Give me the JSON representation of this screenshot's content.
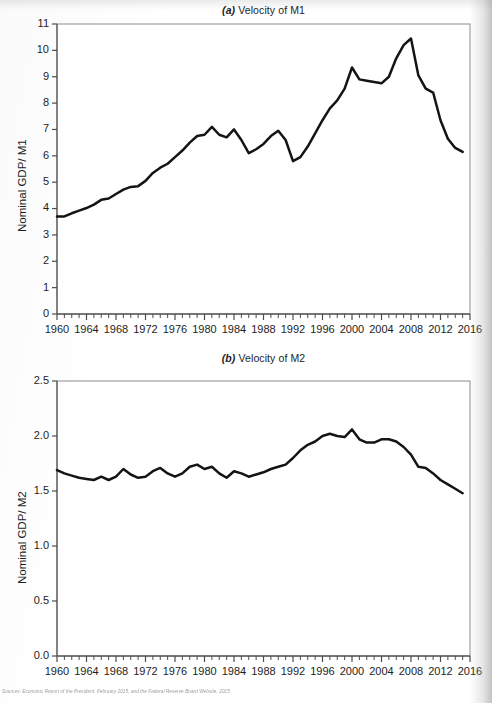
{
  "figure": {
    "source_note_prefix": "Sources:",
    "source_note": "Economic Report of the President, February 2015, and the Federal Reserve Board Website, 2015"
  },
  "panel_a": {
    "title_tag": "(a)",
    "title_text": " Velocity of M1",
    "ylabel": "Nominal GDP/ M1"
  },
  "panel_b": {
    "title_tag": "(b)",
    "title_text": " Velocity of M2",
    "ylabel": "Nominal GDP/ M2"
  },
  "chart_data": [
    {
      "type": "line",
      "title": "(a) Velocity of M1",
      "xlabel": "",
      "ylabel": "Nominal GDP/ M1",
      "xlim": [
        1960,
        2016
      ],
      "ylim": [
        0,
        11
      ],
      "yticks": [
        0,
        1,
        2,
        3,
        4,
        5,
        6,
        7,
        8,
        9,
        10,
        11
      ],
      "ytick_labels": [
        "0",
        "1",
        "2",
        "3",
        "4",
        "5",
        "6",
        "7",
        "8",
        "9",
        "10",
        "11"
      ],
      "xticks": [
        1960,
        1964,
        1968,
        1972,
        1976,
        1980,
        1984,
        1988,
        1992,
        1996,
        2000,
        2004,
        2008,
        2012,
        2016
      ],
      "xtick_labels": [
        "1960",
        "1964",
        "1968",
        "1972",
        "1976",
        "1980",
        "1984",
        "1988",
        "1992",
        "1996",
        "2000",
        "2004",
        "2008",
        "2012",
        "2016"
      ],
      "x_minor_tick_step": 1,
      "grid": false,
      "legend": null,
      "line_color": "#141414",
      "x": [
        1960,
        1961,
        1962,
        1963,
        1964,
        1965,
        1966,
        1967,
        1968,
        1969,
        1970,
        1971,
        1972,
        1973,
        1974,
        1975,
        1976,
        1977,
        1978,
        1979,
        1980,
        1981,
        1982,
        1983,
        1984,
        1985,
        1986,
        1987,
        1988,
        1989,
        1990,
        1991,
        1992,
        1993,
        1994,
        1995,
        1996,
        1997,
        1998,
        1999,
        2000,
        2001,
        2002,
        2003,
        2004,
        2005,
        2006,
        2007,
        2008,
        2009,
        2010,
        2011,
        2012,
        2013,
        2014,
        2015
      ],
      "y": [
        3.7,
        3.7,
        3.82,
        3.92,
        4.02,
        4.15,
        4.33,
        4.38,
        4.55,
        4.72,
        4.82,
        4.85,
        5.05,
        5.35,
        5.55,
        5.7,
        5.95,
        6.2,
        6.5,
        6.75,
        6.8,
        7.1,
        6.8,
        6.7,
        7.0,
        6.6,
        6.1,
        6.25,
        6.45,
        6.75,
        6.95,
        6.6,
        5.8,
        5.95,
        6.35,
        6.85,
        7.35,
        7.8,
        8.1,
        8.55,
        9.35,
        8.9,
        8.85,
        8.8,
        8.75,
        9.0,
        9.7,
        10.2,
        10.45,
        9.05,
        8.55,
        8.4,
        7.35,
        6.65,
        6.3,
        6.15
      ],
      "notes": "Velocity of M1 rises from ~3.7 in 1960 to a local peak ~7.1 near 1981, dips to ~6.1 in 1986, peaks ~6.95 in 1990, falls to ~5.8 in 1992, then climbs to ~9.35 in 2000, dips to ~8.75 by 2004, peaks ~10.45 in 2008, then declines to ~6.0 by 2015"
    },
    {
      "type": "line",
      "title": "(b) Velocity of M2",
      "xlabel": "",
      "ylabel": "Nominal GDP/ M2",
      "xlim": [
        1960,
        2016
      ],
      "ylim": [
        0.0,
        2.5
      ],
      "yticks": [
        0.0,
        0.5,
        1.0,
        1.5,
        2.0,
        2.5
      ],
      "ytick_labels": [
        "0.0",
        "0.5",
        "1.0",
        "1.5",
        "2.0",
        "2.5"
      ],
      "xticks": [
        1960,
        1964,
        1968,
        1972,
        1976,
        1980,
        1984,
        1988,
        1992,
        1996,
        2000,
        2004,
        2008,
        2012,
        2016
      ],
      "xtick_labels": [
        "1960",
        "1964",
        "1968",
        "1972",
        "1976",
        "1980",
        "1984",
        "1988",
        "1992",
        "1996",
        "2000",
        "2004",
        "2008",
        "2012",
        "2016"
      ],
      "x_minor_tick_step": 1,
      "grid": false,
      "legend": null,
      "line_color": "#141414",
      "x": [
        1960,
        1961,
        1962,
        1963,
        1964,
        1965,
        1966,
        1967,
        1968,
        1969,
        1970,
        1971,
        1972,
        1973,
        1974,
        1975,
        1976,
        1977,
        1978,
        1979,
        1980,
        1981,
        1982,
        1983,
        1984,
        1985,
        1986,
        1987,
        1988,
        1989,
        1990,
        1991,
        1992,
        1993,
        1994,
        1995,
        1996,
        1997,
        1998,
        1999,
        2000,
        2001,
        2002,
        2003,
        2004,
        2005,
        2006,
        2007,
        2008,
        2009,
        2010,
        2011,
        2012,
        2013,
        2014,
        2015
      ],
      "y": [
        1.69,
        1.66,
        1.64,
        1.62,
        1.61,
        1.6,
        1.63,
        1.6,
        1.63,
        1.7,
        1.65,
        1.62,
        1.63,
        1.68,
        1.71,
        1.66,
        1.63,
        1.66,
        1.72,
        1.74,
        1.7,
        1.72,
        1.66,
        1.62,
        1.68,
        1.66,
        1.63,
        1.65,
        1.67,
        1.7,
        1.72,
        1.74,
        1.8,
        1.87,
        1.92,
        1.95,
        2.0,
        2.02,
        2.0,
        1.99,
        2.06,
        1.97,
        1.94,
        1.94,
        1.97,
        1.97,
        1.95,
        1.9,
        1.83,
        1.72,
        1.71,
        1.66,
        1.6,
        1.56,
        1.52,
        1.48
      ],
      "notes": "Velocity of M2 hovers near 1.6-1.75 from 1960 through 1992, rises to a plateau near 2.0 during 1996-2000 (peak ~2.06 in 2000), eases to ~1.95 through 2006, then declines steadily to ~1.48 by 2015"
    }
  ]
}
